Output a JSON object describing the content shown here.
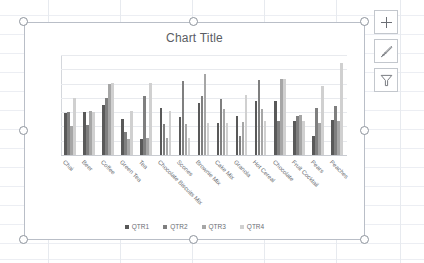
{
  "app": {
    "context": "excel-worksheet-with-selected-chart"
  },
  "chart_buttons": [
    {
      "name": "chart-elements-button",
      "icon": "plus-icon",
      "label": "Chart Elements"
    },
    {
      "name": "chart-styles-button",
      "icon": "paintbrush-icon",
      "label": "Chart Styles"
    },
    {
      "name": "chart-filters-button",
      "icon": "funnel-icon",
      "label": "Chart Filters"
    }
  ],
  "selection_handles": [
    "top-left",
    "top-center",
    "top-right",
    "middle-left",
    "middle-right",
    "bottom-left",
    "bottom-center",
    "bottom-right"
  ],
  "colors": {
    "qtr1": "#595959",
    "qtr2": "#7f7f7f",
    "qtr3": "#a6a6a6",
    "qtr4": "#d0d0d0",
    "gridline": "#e8eaee",
    "axis": "#c9ccd2",
    "text": "#6b6e74",
    "chart_border": "#b9bec7"
  },
  "chart_data": {
    "type": "bar",
    "title": "Chart Title",
    "xlabel": "",
    "ylabel": "",
    "ylim": [
      0,
      700
    ],
    "yticks": [
      0,
      100,
      200,
      300,
      400,
      500,
      600,
      700
    ],
    "grid": true,
    "legend_position": "bottom",
    "categories": [
      "Chai",
      "Beer",
      "Coffee",
      "Green Tea",
      "Tea",
      "Chocolate Biscuits Mix",
      "Scones",
      "Brownie Mix",
      "Cake Mix",
      "Granola",
      "Hot Cereal",
      "Chocolate",
      "Fruit Cocktail",
      "Pears",
      "Peaches"
    ],
    "series": [
      {
        "name": "QTR1",
        "color": "#595959",
        "values": [
          295,
          300,
          350,
          255,
          115,
          330,
          265,
          365,
          225,
          270,
          375,
          380,
          240,
          135,
          245
        ]
      },
      {
        "name": "QTR2",
        "color": "#7f7f7f",
        "values": [
          300,
          210,
          400,
          160,
          410,
          215,
          515,
          415,
          390,
          130,
          525,
          235,
          270,
          330,
          340
        ]
      },
      {
        "name": "QTR3",
        "color": "#a6a6a6",
        "values": [
          200,
          305,
          500,
          110,
          120,
          120,
          220,
          570,
          320,
          230,
          325,
          530,
          280,
          225,
          240
        ]
      },
      {
        "name": "QTR4",
        "color": "#d0d0d0",
        "values": [
          400,
          300,
          505,
          305,
          505,
          310,
          120,
          225,
          225,
          420,
          235,
          530,
          235,
          485,
          645
        ]
      }
    ]
  },
  "legend": [
    {
      "label": "QTR1",
      "color": "#595959"
    },
    {
      "label": "QTR2",
      "color": "#7f7f7f"
    },
    {
      "label": "QTR3",
      "color": "#a6a6a6"
    },
    {
      "label": "QTR4",
      "color": "#d0d0d0"
    }
  ]
}
